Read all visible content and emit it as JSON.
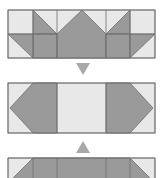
{
  "colors": {
    "background": "#ffffff",
    "light": "#e8e8e8",
    "dark": "#9a9a9a",
    "border": "#6e6e6e",
    "arrow": "#a8a8a8"
  },
  "diagram": {
    "panels": [
      {
        "name": "top-block"
      },
      {
        "name": "middle-block"
      },
      {
        "name": "bottom-block"
      }
    ],
    "arrows": [
      {
        "name": "down-arrow",
        "direction": "down"
      },
      {
        "name": "up-arrow",
        "direction": "up"
      }
    ]
  }
}
